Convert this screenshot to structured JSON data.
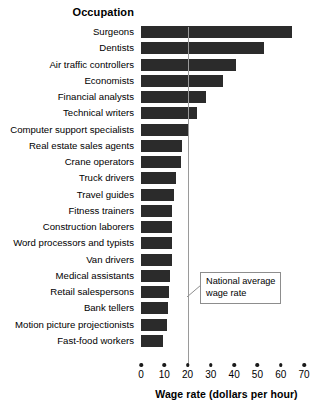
{
  "chart_data": {
    "type": "bar",
    "orientation": "horizontal",
    "title": "",
    "xlabel": "Wage rate (dollars per hour)",
    "ylabel": "Occupation",
    "xlim": [
      0,
      70
    ],
    "xticks": [
      0,
      10,
      20,
      30,
      40,
      50,
      60,
      70
    ],
    "xtick_labels": [
      "0",
      "10",
      "20",
      "30",
      "40",
      "50",
      "60",
      "70"
    ],
    "grid": false,
    "legend": null,
    "bar_color": "#2b2b2b",
    "categories": [
      "Surgeons",
      "Dentists",
      "Air traffic controllers",
      "Economists",
      "Financial analysts",
      "Technical writers",
      "Computer support specialists",
      "Real estate sales agents",
      "Crane operators",
      "Truck drivers",
      "Travel guides",
      "Fitness trainers",
      "Construction laborers",
      "Word processors and typists",
      "Van drivers",
      "Medical assistants",
      "Retail salespersons",
      "Bank tellers",
      "Motion picture projectionists",
      "Fast-food workers"
    ],
    "values": [
      65,
      53,
      41,
      35,
      28,
      24,
      20,
      17.5,
      17,
      15,
      14,
      13.5,
      13.5,
      13.5,
      13.5,
      12.5,
      12,
      11.5,
      11,
      9.5
    ],
    "annotations": [
      {
        "name": "national-average-wage-rate",
        "text": "National average wage rate",
        "text_line_1": "National average",
        "text_line_2": "wage rate",
        "value": 20,
        "line_color": "#9a9a9a"
      }
    ]
  },
  "axis": {
    "y_title": "Occupation",
    "x_title": "Wage rate (dollars per hour)"
  }
}
